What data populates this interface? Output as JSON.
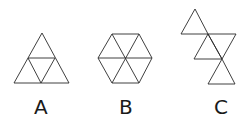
{
  "figures": [
    {
      "id": "A",
      "label": "A",
      "description": "Large triangle subdivided into 4 equilateral triangles"
    },
    {
      "id": "B",
      "label": "B",
      "description": "Regular hexagon subdivided into 6 equilateral triangles"
    },
    {
      "id": "C",
      "label": "C",
      "description": "Zigzag strip of 4 equilateral triangles"
    }
  ],
  "colors": {
    "stroke": "#2a2a2a",
    "background": "#ffffff"
  }
}
